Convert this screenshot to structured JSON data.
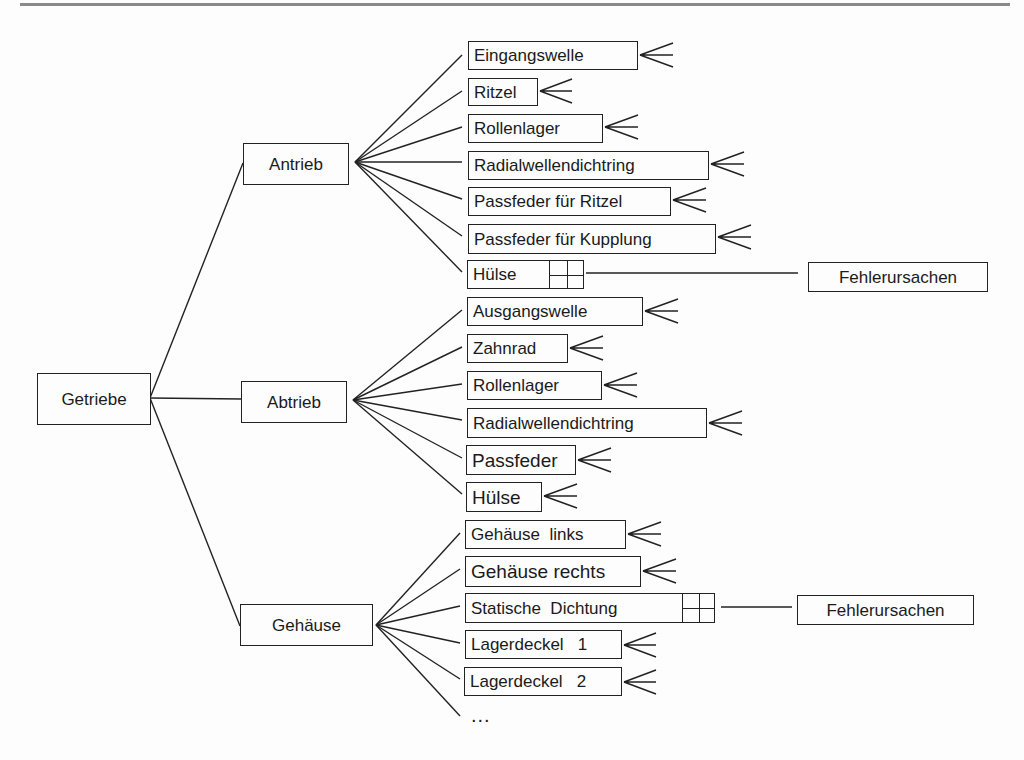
{
  "diagram": {
    "type": "tree",
    "root": {
      "label": "Getriebe"
    },
    "groups": [
      {
        "label": "Antrieb",
        "parts": [
          "Eingangswelle",
          "Ritzel",
          "Rollenlager",
          "Radialwellendichtring",
          "Passfeder für Ritzel",
          "Passfeder für Kupplung",
          "Hülse"
        ],
        "expanded_part": "Hülse"
      },
      {
        "label": "Abtrieb",
        "parts": [
          "Ausgangswelle",
          "Zahnrad",
          "Rollenlager",
          "Radialwellendichtring",
          "Passfeder",
          "Hülse"
        ]
      },
      {
        "label": "Gehäuse",
        "parts": [
          "Gehäuse  links",
          "Gehäuse rechts",
          "Statische  Dichtung",
          "Lagerdeckel   1",
          "Lagerdeckel   2"
        ],
        "expanded_part": "Statische  Dichtung",
        "more": "..."
      }
    ],
    "detail_boxes": [
      {
        "label": "Fehlerursachen",
        "attached_to": "Antrieb/Hülse"
      },
      {
        "label": "Fehlerursachen",
        "attached_to": "Gehäuse/Statische Dichtung"
      }
    ],
    "icons": {
      "fan_out": "crowfoot-icon",
      "expand": "grid-icon"
    }
  }
}
